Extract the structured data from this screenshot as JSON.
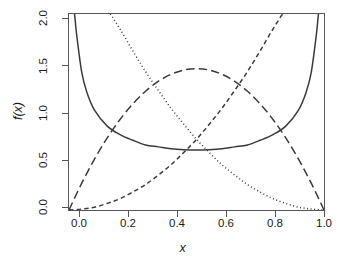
{
  "figure": {
    "background": "#ffffff",
    "foreground": "#404040",
    "axis_color": "#555555",
    "width": 349,
    "height": 277
  },
  "chart_data": {
    "type": "line",
    "title": "",
    "subtitle": "",
    "xlabel": "x",
    "ylabel": "f(x)",
    "xlim": [
      0.0,
      1.0
    ],
    "ylim": [
      0.0,
      2.08
    ],
    "grid": false,
    "legend": "none",
    "x_ticks": [
      0.0,
      0.2,
      0.4,
      0.6,
      0.8,
      1.0
    ],
    "x_tick_labels": [
      "0.0",
      "0.2",
      "0.4",
      "0.6",
      "0.8",
      "1.0"
    ],
    "y_ticks": [
      0.0,
      0.5,
      1.0,
      1.5,
      2.0
    ],
    "y_tick_labels": [
      "0.0",
      "0.5",
      "1.0",
      "1.5",
      "2.0"
    ],
    "series": [
      {
        "name": "beta-0.5-0.5",
        "linestyle": "solid",
        "color": "#3a3a3a",
        "width": 1.5,
        "description": "U-shaped symmetric density, minimum 0.637 at x=0.5, rises to infinity at both ends",
        "x": [
          0.005,
          0.01,
          0.02,
          0.03,
          0.05,
          0.07,
          0.1,
          0.15,
          0.2,
          0.25,
          0.3,
          0.35,
          0.4,
          0.45,
          0.5,
          0.55,
          0.6,
          0.65,
          0.7,
          0.75,
          0.8,
          0.85,
          0.9,
          0.93,
          0.95,
          0.97,
          0.98,
          0.99,
          0.995
        ],
        "y": [
          4.51,
          3.2,
          2.27,
          1.86,
          1.46,
          1.25,
          1.06,
          0.89,
          0.8,
          0.74,
          0.69,
          0.67,
          0.65,
          0.64,
          0.637,
          0.64,
          0.65,
          0.67,
          0.69,
          0.74,
          0.8,
          0.89,
          1.06,
          1.25,
          1.46,
          1.86,
          2.27,
          3.2,
          4.51
        ]
      },
      {
        "name": "beta-1-3",
        "linestyle": "dotted",
        "color": "#3a3a3a",
        "width": 1.5,
        "description": "Monotone decreasing density 3(1-x)^2, enters top of panel near x=0.06, reaches 0 at x=1",
        "x": [
          0.0,
          0.05,
          0.1,
          0.15,
          0.2,
          0.25,
          0.3,
          0.35,
          0.4,
          0.45,
          0.5,
          0.55,
          0.6,
          0.65,
          0.7,
          0.75,
          0.8,
          0.85,
          0.9,
          0.95,
          1.0
        ],
        "y": [
          3.0,
          2.71,
          2.43,
          2.17,
          1.92,
          1.69,
          1.47,
          1.27,
          1.08,
          0.91,
          0.75,
          0.61,
          0.48,
          0.37,
          0.27,
          0.19,
          0.12,
          0.07,
          0.03,
          0.01,
          0.0
        ]
      },
      {
        "name": "beta-3-1",
        "linestyle": "dashed",
        "color": "#3a3a3a",
        "width": 1.5,
        "description": "Monotone increasing density 3x^2, starts at 0 at x=0, exits top of panel near x=0.94",
        "x": [
          0.0,
          0.05,
          0.1,
          0.15,
          0.2,
          0.25,
          0.3,
          0.35,
          0.4,
          0.45,
          0.5,
          0.55,
          0.6,
          0.65,
          0.7,
          0.75,
          0.8,
          0.85,
          0.9,
          0.95,
          1.0
        ],
        "y": [
          0.0,
          0.01,
          0.03,
          0.07,
          0.12,
          0.19,
          0.27,
          0.37,
          0.48,
          0.61,
          0.75,
          0.91,
          1.08,
          1.27,
          1.47,
          1.69,
          1.92,
          2.17,
          2.43,
          2.71,
          3.0
        ]
      },
      {
        "name": "beta-2-2",
        "linestyle": "longdash",
        "color": "#3a3a3a",
        "width": 1.5,
        "description": "Symmetric hump density 6x(1-x), peaks at 1.5 at x=0.5, zero at both ends",
        "x": [
          0.0,
          0.05,
          0.1,
          0.15,
          0.2,
          0.25,
          0.3,
          0.35,
          0.4,
          0.45,
          0.5,
          0.55,
          0.6,
          0.65,
          0.7,
          0.75,
          0.8,
          0.85,
          0.9,
          0.95,
          1.0
        ],
        "y": [
          0.0,
          0.285,
          0.54,
          0.765,
          0.96,
          1.125,
          1.26,
          1.365,
          1.44,
          1.485,
          1.5,
          1.485,
          1.44,
          1.365,
          1.26,
          1.125,
          0.96,
          0.765,
          0.54,
          0.285,
          0.0
        ]
      }
    ]
  }
}
